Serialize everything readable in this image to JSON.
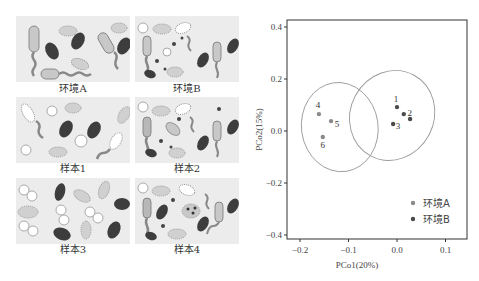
{
  "panels": [
    {
      "label": "环境A",
      "kind": "env-a"
    },
    {
      "label": "环境B",
      "kind": "env-b"
    },
    {
      "label": "样本1",
      "kind": "sample-1"
    },
    {
      "label": "样本2",
      "kind": "sample-2"
    },
    {
      "label": "样本3",
      "kind": "sample-3"
    },
    {
      "label": "样本4",
      "kind": "sample-4"
    }
  ],
  "colors": {
    "env_a": "#8a8a8a",
    "env_b": "#4a4a4a",
    "ellipse": "#9a9a9a",
    "frame": "#333333",
    "panel_bg": "#ececec",
    "dark_cell": "#3d3d3d",
    "light_cell": "#c8c8c8"
  },
  "chart_data": {
    "type": "scatter",
    "title": "",
    "xlabel": "PCo1(20%)",
    "ylabel": "PCo2(15%)",
    "xlim": [
      -0.23,
      0.145
    ],
    "ylim": [
      -0.42,
      0.43
    ],
    "xticks": [
      -0.2,
      -0.1,
      0.0,
      0.1
    ],
    "xtick_labels": [
      "−0.2",
      "−0.1",
      "0.0",
      "0.1"
    ],
    "yticks": [
      -0.4,
      -0.2,
      0.0,
      0.2,
      0.4
    ],
    "ytick_labels": [
      "−0.4",
      "−0.2",
      "0.0",
      "0.2",
      "0.4"
    ],
    "grid": false,
    "legend_position": "lower right",
    "series": [
      {
        "name": "环境A",
        "points": [
          {
            "label": "4",
            "x": -0.161,
            "y": 0.065
          },
          {
            "label": "5",
            "x": -0.136,
            "y": 0.038
          },
          {
            "label": "6",
            "x": -0.153,
            "y": -0.023
          }
        ],
        "ellipse": {
          "cx": -0.118,
          "cy": 0.015,
          "rx": 0.079,
          "ry": 0.172,
          "angle": -8
        }
      },
      {
        "name": "环境B",
        "points": [
          {
            "label": "1",
            "x": 0.0,
            "y": 0.092
          },
          {
            "label": "2",
            "x": 0.014,
            "y": 0.065
          },
          {
            "label": "",
            "x": 0.027,
            "y": 0.046
          },
          {
            "label": "3",
            "x": -0.008,
            "y": 0.027
          }
        ],
        "ellipse": {
          "cx": -0.01,
          "cy": 0.06,
          "rx": 0.086,
          "ry": 0.176,
          "angle": 28
        }
      }
    ]
  }
}
